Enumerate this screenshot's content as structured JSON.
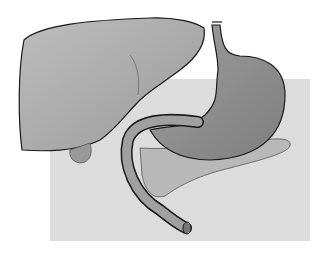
{
  "figure": {
    "title": "",
    "colors": {
      "background": "#ffffff",
      "panel": "#dcdcdc",
      "liver": "#a9a9a9",
      "stomach": "#8f8f8f",
      "pancreas": "#b8b8b8",
      "outline": "#1a1a1a"
    }
  }
}
